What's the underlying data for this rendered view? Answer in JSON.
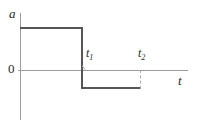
{
  "figure": {
    "background_color": "#ffffff",
    "width": 201,
    "height": 127,
    "axis_color": "#9b9b9b",
    "curve_color": "#555555",
    "dash_color": "#a8a8a8",
    "text_color": "#2b2b2b"
  },
  "labels": {
    "y_axis": "a",
    "x_axis": "t",
    "origin": "0",
    "t1_base": "t",
    "t1_sub": "1",
    "t2_base": "t",
    "t2_sub": "2"
  },
  "chart_data": {
    "type": "line",
    "title": "",
    "subtitle": "",
    "xlabel": "t",
    "ylabel": "a",
    "grid": false,
    "legend": "none",
    "annotations": [
      {
        "text": "t1",
        "x": 1,
        "y": 0,
        "note": "time of step-down from positive to negative acceleration"
      },
      {
        "text": "t2",
        "x": 2,
        "y": 0,
        "note": "time at which the negative acceleration segment ends"
      },
      {
        "text": "0",
        "x": 0,
        "y": 0,
        "note": "origin marker on the vertical axis"
      }
    ],
    "xlim": [
      0,
      3
    ],
    "ylim": [
      -1.6,
      1.6
    ],
    "xtick_labels": [
      "t1",
      "t2"
    ],
    "xticks": [
      1,
      2
    ],
    "ytick_labels": [
      "0"
    ],
    "yticks": [
      0
    ],
    "series": [
      {
        "name": "acceleration",
        "style": "solid",
        "color": "#555555",
        "x": [
          0,
          1,
          1,
          2
        ],
        "values": [
          1.0,
          1.0,
          -1.0,
          -1.0
        ],
        "description": "Piecewise-constant acceleration: constant positive value from t=0 to t1, instantaneous step down, constant negative value from t1 to t2."
      },
      {
        "name": "t2-dropline",
        "style": "dashed",
        "color": "#a8a8a8",
        "x": [
          2,
          2
        ],
        "values": [
          0,
          -1.0
        ],
        "description": "Dashed vertical guide from the t axis down to the end of the negative segment at t2."
      }
    ]
  }
}
